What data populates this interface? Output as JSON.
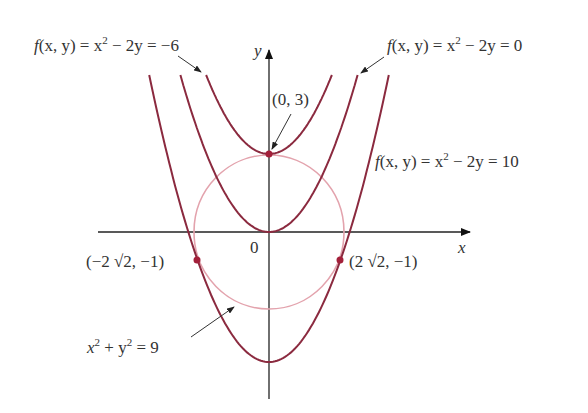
{
  "chart_data": {
    "type": "contour",
    "title": "",
    "xlabel": "x",
    "ylabel": "y",
    "origin_label": "0",
    "function": "f(x, y) = x^2 - 2y",
    "level_curves": [
      {
        "level": -6,
        "equation": "y = (x^2 + 6) / 2",
        "vertex": [
          0,
          3
        ]
      },
      {
        "level": 0,
        "equation": "y = x^2 / 2",
        "vertex": [
          0,
          0
        ]
      },
      {
        "level": 10,
        "equation": "y = (x^2 - 10) / 2",
        "vertex": [
          0,
          -5
        ]
      }
    ],
    "constraint": {
      "equation": "x^2 + y^2 = 9",
      "center": [
        0,
        0
      ],
      "radius": 3
    },
    "points": [
      {
        "label": "(0, 3)",
        "x": 0,
        "y": 3
      },
      {
        "label": "(-2√2, -1)",
        "x": -2.828,
        "y": -1
      },
      {
        "label": "(2√2, -1)",
        "x": 2.828,
        "y": -1
      }
    ],
    "xlim": [
      -6.7,
      7.8
    ],
    "ylim": [
      -6.4,
      7
    ],
    "colors": {
      "level_curves": "#8b2a3f",
      "circle": "#e3a3ad",
      "points": "#a3203a",
      "axes": "#222222"
    }
  },
  "labels": {
    "level_neg6_prefix": "f",
    "level_neg6": "(x, y) = x",
    "level_neg6_tail": " − 2y = −6",
    "level_0_prefix": "f",
    "level_0": "(x, y) = x",
    "level_0_tail": " − 2y = 0",
    "level_10_prefix": "f",
    "level_10": "(x, y) = x",
    "level_10_tail": " − 2y = 10",
    "sup2": "2",
    "point_top": "(0, 3)",
    "point_left": "(−2 √2, −1)",
    "point_right": "(2 √2, −1)",
    "circle_x": "x",
    "circle_mid": " + y",
    "circle_tail": " = 9",
    "axis_x": "x",
    "axis_y": "y",
    "origin": "0"
  }
}
